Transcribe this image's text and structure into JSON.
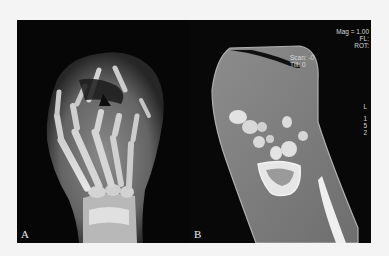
{
  "figure": {
    "panels": [
      {
        "id": "A",
        "label": "A",
        "description": "Dorsopalmar radiograph of crushed hand with comminuted phalangeal fractures"
      },
      {
        "id": "B",
        "label": "B",
        "description": "Coronal CT reconstruction of wrist showing carpal bones and distal radius/ulna",
        "overlay": {
          "mag": "Mag = 1.00",
          "fl": "FL:",
          "rot": "ROT:",
          "scan": "Scan: -0",
          "tilt": "Tilt: 0",
          "side": [
            "L",
            "1",
            "5",
            "2"
          ]
        }
      }
    ],
    "colors": {
      "background": "#f4f4f4",
      "panel": "#050505",
      "bone": "#d9d9d9",
      "soft_tissue": "#8a8a8a"
    }
  }
}
